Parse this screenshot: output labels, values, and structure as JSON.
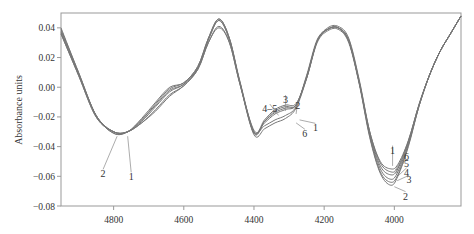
{
  "chart_data": {
    "type": "line",
    "title": "",
    "xlabel": "",
    "ylabel": "Absorbance units",
    "xlim": [
      4950,
      3810
    ],
    "ylim": [
      -0.08,
      0.05
    ],
    "x_reversed": true,
    "grid": false,
    "x_ticks": [
      4800,
      4600,
      4400,
      4200,
      4000
    ],
    "x_tick_labels": [
      "4800",
      "4600",
      "4400",
      "4200",
      "4000"
    ],
    "y_ticks": [
      0.04,
      0.02,
      0.0,
      -0.02,
      -0.04,
      -0.06,
      -0.08
    ],
    "y_tick_labels": [
      "0.04",
      "0.02",
      "0.00",
      "−0.02",
      "−0.04",
      "−0.06",
      "−0.08"
    ],
    "x": [
      4950,
      4900,
      4850,
      4800,
      4760,
      4720,
      4680,
      4640,
      4600,
      4560,
      4530,
      4500,
      4470,
      4440,
      4400,
      4370,
      4340,
      4310,
      4280,
      4250,
      4220,
      4190,
      4160,
      4130,
      4100,
      4070,
      4040,
      4010,
      3990,
      3960,
      3930,
      3900,
      3870,
      3840,
      3810
    ],
    "series": [
      {
        "name": "1",
        "values": [
          0.036,
          0.008,
          -0.02,
          -0.03,
          -0.03,
          -0.024,
          -0.016,
          -0.006,
          0.001,
          0.012,
          0.03,
          0.041,
          0.03,
          0.002,
          -0.029,
          -0.026,
          -0.022,
          -0.019,
          -0.013,
          0.008,
          0.032,
          0.039,
          0.04,
          0.032,
          0.004,
          -0.03,
          -0.05,
          -0.055,
          -0.052,
          -0.036,
          -0.012,
          0.008,
          0.024,
          0.036,
          0.048
        ]
      },
      {
        "name": "2",
        "values": [
          0.04,
          0.01,
          -0.019,
          -0.031,
          -0.03,
          -0.021,
          -0.01,
          0.0,
          0.003,
          0.014,
          0.033,
          0.046,
          0.033,
          0.004,
          -0.03,
          -0.022,
          -0.015,
          -0.012,
          -0.011,
          0.006,
          0.03,
          0.038,
          0.039,
          0.03,
          0.002,
          -0.034,
          -0.058,
          -0.066,
          -0.06,
          -0.04,
          -0.013,
          0.008,
          0.024,
          0.036,
          0.048
        ]
      },
      {
        "name": "3",
        "values": [
          0.039,
          0.01,
          -0.019,
          -0.031,
          -0.03,
          -0.022,
          -0.011,
          -0.001,
          0.003,
          0.014,
          0.033,
          0.046,
          0.033,
          0.003,
          -0.031,
          -0.023,
          -0.016,
          -0.013,
          -0.012,
          0.006,
          0.031,
          0.039,
          0.04,
          0.031,
          0.003,
          -0.033,
          -0.057,
          -0.064,
          -0.059,
          -0.039,
          -0.013,
          0.008,
          0.024,
          0.036,
          0.048
        ]
      },
      {
        "name": "4",
        "values": [
          0.038,
          0.009,
          -0.019,
          -0.03,
          -0.03,
          -0.022,
          -0.012,
          -0.002,
          0.002,
          0.013,
          0.032,
          0.045,
          0.032,
          0.003,
          -0.031,
          -0.023,
          -0.017,
          -0.014,
          -0.012,
          0.007,
          0.031,
          0.039,
          0.04,
          0.031,
          0.003,
          -0.032,
          -0.055,
          -0.062,
          -0.057,
          -0.038,
          -0.013,
          0.008,
          0.024,
          0.036,
          0.048
        ]
      },
      {
        "name": "5",
        "values": [
          0.037,
          0.009,
          -0.019,
          -0.03,
          -0.03,
          -0.023,
          -0.013,
          -0.003,
          0.002,
          0.013,
          0.032,
          0.045,
          0.032,
          0.003,
          -0.03,
          -0.024,
          -0.018,
          -0.015,
          -0.012,
          0.007,
          0.031,
          0.039,
          0.04,
          0.031,
          0.003,
          -0.031,
          -0.053,
          -0.059,
          -0.055,
          -0.037,
          -0.012,
          0.008,
          0.024,
          0.036,
          0.048
        ]
      },
      {
        "name": "6",
        "values": [
          0.036,
          0.008,
          -0.02,
          -0.03,
          -0.03,
          -0.024,
          -0.015,
          -0.005,
          0.001,
          0.012,
          0.03,
          0.04,
          0.03,
          0.002,
          -0.032,
          -0.028,
          -0.024,
          -0.021,
          -0.014,
          0.006,
          0.031,
          0.04,
          0.041,
          0.033,
          0.005,
          -0.03,
          -0.051,
          -0.057,
          -0.054,
          -0.036,
          -0.012,
          0.008,
          0.024,
          0.036,
          0.048
        ]
      }
    ],
    "annotations": [
      {
        "text": "2",
        "x": 4830,
        "y": -0.058,
        "target_x": 4790,
        "target_y": -0.033
      },
      {
        "text": "1",
        "x": 4750,
        "y": -0.06,
        "target_x": 4760,
        "target_y": -0.033
      },
      {
        "text": "3",
        "x": 4310,
        "y": -0.008,
        "target_x": 4310,
        "target_y": -0.016
      },
      {
        "text": "4–5",
        "x": 4355,
        "y": -0.014,
        "target_x": 4330,
        "target_y": -0.019
      },
      {
        "text": "2",
        "x": 4275,
        "y": -0.012,
        "target_x": 4280,
        "target_y": -0.018
      },
      {
        "text": "1",
        "x": 4225,
        "y": -0.027,
        "target_x": 4270,
        "target_y": -0.022
      },
      {
        "text": "6",
        "x": 4255,
        "y": -0.031,
        "target_x": 4280,
        "target_y": -0.024
      },
      {
        "text": "1",
        "x": 4005,
        "y": -0.042,
        "target_x": 4005,
        "target_y": -0.053
      },
      {
        "text": "6",
        "x": 3965,
        "y": -0.046,
        "target_x": 3998,
        "target_y": -0.056
      },
      {
        "text": "5",
        "x": 3965,
        "y": -0.051,
        "target_x": 3996,
        "target_y": -0.058
      },
      {
        "text": "4",
        "x": 3965,
        "y": -0.057,
        "target_x": 3995,
        "target_y": -0.061
      },
      {
        "text": "3",
        "x": 3958,
        "y": -0.062,
        "target_x": 3992,
        "target_y": -0.063
      },
      {
        "text": "2",
        "x": 3968,
        "y": -0.073,
        "target_x": 4000,
        "target_y": -0.067
      }
    ]
  }
}
